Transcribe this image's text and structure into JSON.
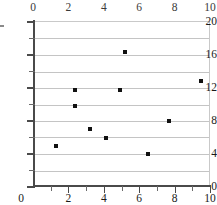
{
  "chart_data": {
    "type": "scatter",
    "title": "",
    "xlabel": "",
    "ylabel": "",
    "xlim": [
      0,
      10
    ],
    "ylim": [
      0,
      20
    ],
    "grid": true,
    "grid_axis": "y",
    "legend": "none",
    "marker": "square",
    "marker_color": "#111111",
    "x": [
      1.3,
      2.4,
      2.4,
      3.2,
      4.1,
      4.9,
      5.2,
      6.5,
      7.7,
      9.5
    ],
    "y": [
      5.0,
      11.8,
      9.8,
      7.0,
      6.0,
      11.8,
      16.4,
      4.0,
      8.0,
      12.8
    ],
    "points": [
      {
        "x": 1.3,
        "y": 5.0
      },
      {
        "x": 2.4,
        "y": 11.8
      },
      {
        "x": 2.4,
        "y": 9.8
      },
      {
        "x": 3.2,
        "y": 7.0
      },
      {
        "x": 4.1,
        "y": 6.0
      },
      {
        "x": 4.9,
        "y": 11.8
      },
      {
        "x": 5.2,
        "y": 16.4
      },
      {
        "x": 6.5,
        "y": 4.0
      },
      {
        "x": 7.7,
        "y": 8.0
      },
      {
        "x": 9.5,
        "y": 12.8
      }
    ],
    "x_ticks_major": [
      0,
      2,
      4,
      6,
      8,
      10
    ],
    "x_ticks_major_labels": [
      "0",
      "2",
      "4",
      "6",
      "8",
      "10"
    ],
    "x_ticks_minor": [
      1,
      3,
      5,
      7,
      9
    ],
    "y_ticks_major": [
      0,
      4,
      8,
      12,
      16,
      20
    ],
    "y_ticks_major_labels": [
      "0",
      "4",
      "8",
      "12",
      "16",
      "20"
    ],
    "y_ticks_minor": [
      2,
      6,
      10,
      14,
      18
    ],
    "gridlines": [
      2,
      4,
      6,
      8,
      10,
      12,
      14,
      16,
      18
    ],
    "top_axis_ticks": [
      0,
      2,
      4,
      6,
      8,
      10
    ],
    "top_axis_labels": [
      "0",
      "2",
      "4",
      "6",
      "8",
      "10"
    ]
  }
}
